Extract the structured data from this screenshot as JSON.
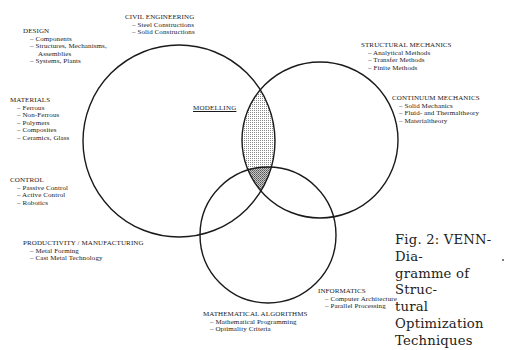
{
  "diagram": {
    "type": "venn",
    "sets": [
      {
        "id": "big",
        "name": "Structural / Design domain circle"
      },
      {
        "id": "right",
        "name": "Mechanics circle"
      },
      {
        "id": "bottom",
        "name": "Algorithms circle"
      }
    ],
    "highlighted_regions": [
      "big∩right",
      "big∩right∩bottom"
    ],
    "center_label": "MODELLING"
  },
  "groups": {
    "design": {
      "title": "DESIGN",
      "items": [
        "Components",
        "Structures, Mechanisms,",
        "Systems, Plants"
      ],
      "continuation": "Assemblies"
    },
    "civil": {
      "title": "CIVIL ENGINEERING",
      "items": [
        "Steel Constructions",
        "Solid Constructions"
      ]
    },
    "structural": {
      "title": "STRUCTURAL MECHANICS",
      "items": [
        "Analytical Methods",
        "Transfer Methods",
        "Finite Methods"
      ]
    },
    "continuum": {
      "title": "CONTINUUM MECHANICS",
      "items": [
        "Solid Mechanics",
        "Fluid- and Thermaltheory",
        "Materialtheory"
      ]
    },
    "materials": {
      "title": "MATERIALS",
      "items": [
        "Ferrous",
        "Non-Ferrous",
        "Polymers",
        "Composites",
        "Ceramics, Glass"
      ]
    },
    "control": {
      "title": "CONTROL",
      "items": [
        "Passive Control",
        "Active Control",
        "Robotics"
      ]
    },
    "productivity": {
      "title": "PRODUCTIVITY / MANUFACTURING",
      "items": [
        "Metal Forming",
        "Cast Metal Technology"
      ]
    },
    "informatics": {
      "title": "INFORMATICS",
      "items": [
        "Computer Architecture",
        "Parallel Processing"
      ]
    },
    "math": {
      "title": "MATHEMATICAL ALGORITHMS",
      "items": [
        "Mathematical Programming",
        "Optimality Criteria"
      ]
    }
  },
  "caption": {
    "lines": [
      "Fig. 2: VENN-Dia-",
      "gramme of Struc-",
      "tural Optimization",
      "Techniques"
    ]
  },
  "colors": {
    "stroke": "#1a1a1a",
    "shade": "#9a9a9a",
    "shade_dark": "#6f6f6f"
  }
}
